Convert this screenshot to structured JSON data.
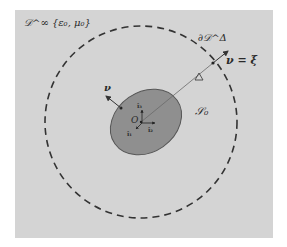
{
  "diagram": {
    "region_label": "𝒟^∞ {ε₀, μ₀}",
    "boundary_label": "∂𝒟^Δ",
    "normal_equation": "ν = ξ",
    "delta_label": "Δ",
    "scatterer_label": "𝒮₀",
    "origin_label": "O",
    "normal_label": "ν",
    "basis": [
      "î₁",
      "î₂",
      "î₃"
    ],
    "colors": {
      "background": "#d4d4d4",
      "scatterer_fill": "#8f8f8f",
      "lines": "#333333"
    }
  }
}
